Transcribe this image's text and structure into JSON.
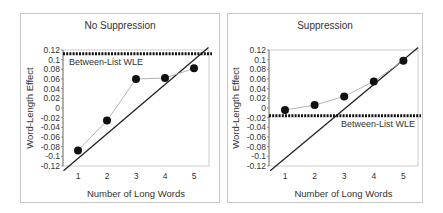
{
  "chart_data": [
    {
      "type": "line",
      "title": "No Suppression",
      "xlabel": "Number of Long Words",
      "ylabel": "Word-Length Effect",
      "categories": [
        1,
        2,
        3,
        4,
        5
      ],
      "x_ticks": [
        "1",
        "2",
        "3",
        "4",
        "5"
      ],
      "y_ticks": [
        "0.12",
        "0.1",
        "0.08",
        "0.06",
        "0.04",
        "0.02",
        "0",
        "-0.02",
        "-0.04",
        "-0.06",
        "-0.08",
        "-0.1",
        "-0.12"
      ],
      "ylim": [
        -0.12,
        0.12
      ],
      "series": [
        {
          "name": "Observed WLE",
          "values": [
            -0.088,
            -0.026,
            0.06,
            0.062,
            0.082
          ],
          "marker": "filled-circle",
          "line_color": "#aaaaaa"
        },
        {
          "name": "Diagonal reference",
          "x": [
            0.5,
            5.5
          ],
          "values": [
            -0.13,
            0.125
          ],
          "line_color": "#222222"
        }
      ],
      "reference_line": {
        "label": "Between-List WLE",
        "value": 0.112,
        "style": "dotted"
      },
      "grid": false
    },
    {
      "type": "line",
      "title": "Suppression",
      "xlabel": "Number of Long Words",
      "ylabel": "Word-Length Effect",
      "categories": [
        1,
        2,
        3,
        4,
        5
      ],
      "x_ticks": [
        "1",
        "2",
        "3",
        "4",
        "5"
      ],
      "y_ticks": [
        "0.12",
        "0.1",
        "0.08",
        "0.06",
        "0.04",
        "0.02",
        "0",
        "-0.02",
        "-0.04",
        "-0.06",
        "-0.08",
        "-0.1",
        "-0.12"
      ],
      "ylim": [
        -0.12,
        0.12
      ],
      "series": [
        {
          "name": "Observed WLE",
          "values": [
            -0.004,
            0.006,
            0.024,
            0.055,
            0.098
          ],
          "marker": "filled-circle",
          "line_color": "#aaaaaa"
        },
        {
          "name": "Diagonal reference",
          "x": [
            0.5,
            5.5
          ],
          "values": [
            -0.13,
            0.125
          ],
          "line_color": "#222222"
        }
      ],
      "reference_line": {
        "label": "Between-List WLE",
        "value": -0.016,
        "style": "dotted"
      },
      "grid": false
    }
  ]
}
